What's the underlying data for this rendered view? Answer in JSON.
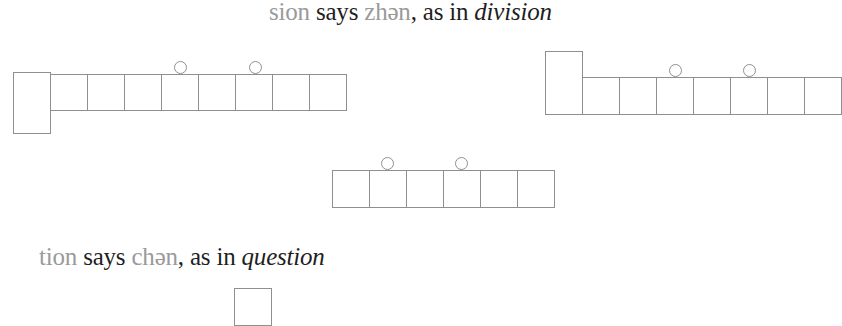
{
  "rule_sion": {
    "suffix": "sion",
    "says": " says ",
    "sound": "zhən",
    "as_in": ", as in ",
    "example": "division"
  },
  "rule_tion": {
    "suffix": "tion",
    "says": " says ",
    "sound": "chən",
    "as_in": ", as in ",
    "example": "question"
  },
  "letter_box_diagrams": [
    {
      "name": "left-word-boxes",
      "tall_boxes": 1,
      "square_boxes": 8,
      "circles_over_boxes": [
        4,
        6
      ]
    },
    {
      "name": "right-word-boxes",
      "tall_boxes": 1,
      "square_boxes": 7,
      "circles_over_boxes": [
        3,
        5
      ]
    },
    {
      "name": "middle-word-boxes",
      "tall_boxes": 0,
      "square_boxes": 6,
      "circles_over_boxes": [
        2,
        4
      ]
    }
  ],
  "colors": {
    "line": "#8f8f8f",
    "grey_text": "#9a9a9a",
    "text": "#1e1e1e"
  }
}
